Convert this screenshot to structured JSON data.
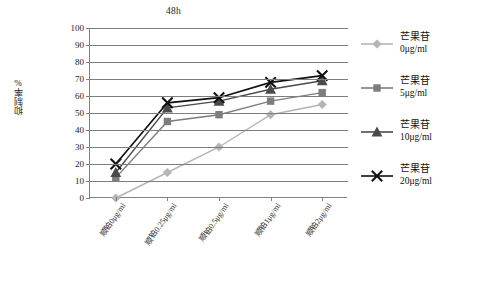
{
  "chart_data": {
    "type": "line",
    "title": "48h",
    "xlabel": "",
    "ylabel": "抑制率%",
    "ylim": [
      0,
      100
    ],
    "ytick_step": 10,
    "yticks": [
      100,
      90,
      80,
      70,
      60,
      50,
      40,
      30,
      20,
      10,
      0
    ],
    "grid": true,
    "legend_position": "right",
    "categories": [
      "顺铂0μg/ml",
      "顺铂0.25μg/ml",
      "顺铂0.5μg/ml",
      "顺铂1μg/ml",
      "顺铂2μg/ml"
    ],
    "series": [
      {
        "name": "芒果苷 0μg/ml",
        "name_line1": "芒果苷",
        "name_line2": "0μg/ml",
        "marker": "diamond",
        "color": "#b5b5b5",
        "values": [
          0,
          15,
          30,
          49,
          55
        ]
      },
      {
        "name": "芒果苷 5μg/ml",
        "name_line1": "芒果苷",
        "name_line2": "5μg/ml",
        "marker": "square",
        "color": "#7d7d7d",
        "values": [
          12,
          45,
          49,
          57,
          62
        ]
      },
      {
        "name": "芒果苷 10μg/ml",
        "name_line1": "芒果苷",
        "name_line2": "10μg/ml",
        "marker": "triangle",
        "color": "#4a4a4a",
        "values": [
          15,
          53,
          57,
          64,
          69
        ]
      },
      {
        "name": "芒果苷 20μg/ml",
        "name_line1": "芒果苷",
        "name_line2": "20μg/ml",
        "marker": "cross-x",
        "color": "#111111",
        "values": [
          20,
          56,
          59,
          68,
          72
        ]
      }
    ]
  }
}
